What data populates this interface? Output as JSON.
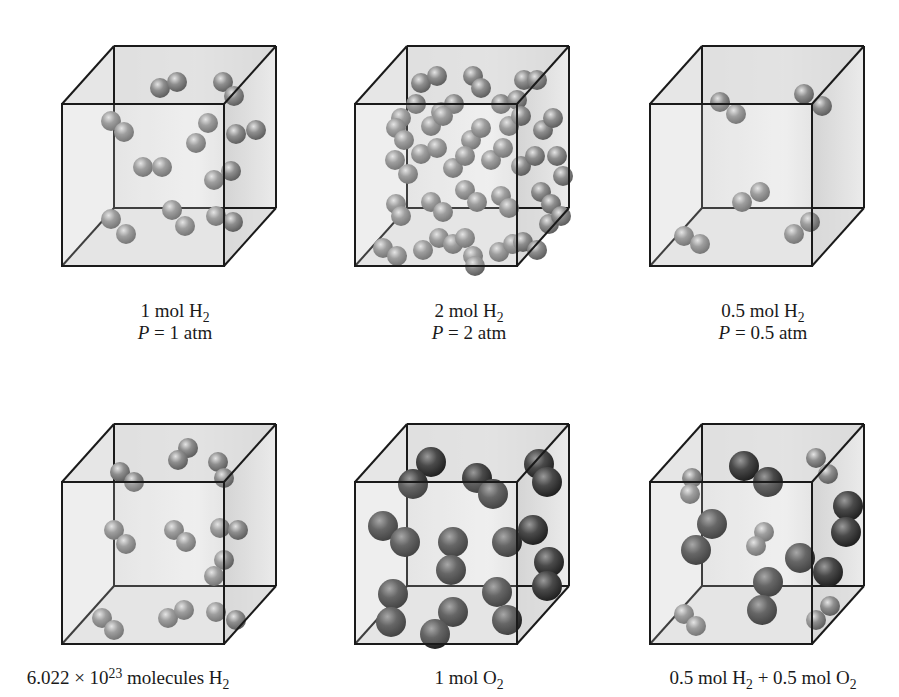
{
  "figure": {
    "colors": {
      "background": "#ffffff",
      "edge": "#1a1a1a",
      "face": "#d6d6d6",
      "h2": "#8e8e8e",
      "o2": "#4a4a4a"
    },
    "cube_geometry": {
      "front_size": 162,
      "depth_dx": 52,
      "depth_dy": 58
    },
    "panels": [
      {
        "id": "1mol-h2",
        "origin": [
          62,
          46
        ],
        "label_line1": {
          "pre": "1 mol H",
          "sub": "2",
          "post": ""
        },
        "label_line2": {
          "var": "P",
          "rest": " = 1 atm"
        },
        "label_pos": [
          175,
          300
        ],
        "molecules": [
          {
            "type": "h2",
            "atoms": [
              [
                92,
                32
              ],
              [
                109,
                26
              ]
            ]
          },
          {
            "type": "h2",
            "atoms": [
              [
                155,
                26
              ],
              [
                166,
                40
              ]
            ]
          },
          {
            "type": "h2",
            "atoms": [
              [
                43,
                65
              ],
              [
                56,
                76
              ]
            ]
          },
          {
            "type": "h2",
            "atoms": [
              [
                140,
                67
              ],
              [
                128,
                87
              ]
            ]
          },
          {
            "type": "h2",
            "atoms": [
              [
                168,
                78
              ],
              [
                188,
                74
              ]
            ]
          },
          {
            "type": "h2",
            "atoms": [
              [
                75,
                111
              ],
              [
                94,
                111
              ]
            ]
          },
          {
            "type": "h2",
            "atoms": [
              [
                146,
                124
              ],
              [
                163,
                115
              ]
            ]
          },
          {
            "type": "h2",
            "atoms": [
              [
                43,
                163
              ],
              [
                58,
                178
              ]
            ]
          },
          {
            "type": "h2",
            "atoms": [
              [
                104,
                154
              ],
              [
                117,
                170
              ]
            ]
          },
          {
            "type": "h2",
            "atoms": [
              [
                148,
                160
              ],
              [
                165,
                166
              ]
            ]
          }
        ]
      },
      {
        "id": "2mol-h2",
        "origin": [
          355,
          46
        ],
        "label_line1": {
          "pre": "2 mol H",
          "sub": "2",
          "post": ""
        },
        "label_line2": {
          "var": "P",
          "rest": " = 2 atm"
        },
        "label_pos": [
          469,
          300
        ],
        "molecules": [
          {
            "type": "h2",
            "atoms": [
              [
                60,
                27
              ],
              [
                76,
                20
              ]
            ]
          },
          {
            "type": "h2",
            "atoms": [
              [
                112,
                20
              ],
              [
                120,
                32
              ]
            ]
          },
          {
            "type": "h2",
            "atoms": [
              [
                163,
                24
              ],
              [
                176,
                24
              ]
            ]
          },
          {
            "type": "h2",
            "atoms": [
              [
                40,
                62
              ],
              [
                55,
                48
              ]
            ]
          },
          {
            "type": "h2",
            "atoms": [
              [
                80,
                56
              ],
              [
                93,
                48
              ]
            ]
          },
          {
            "type": "h2",
            "atoms": [
              [
                140,
                48
              ],
              [
                156,
                44
              ]
            ]
          },
          {
            "type": "h2",
            "atoms": [
              [
                35,
                72
              ],
              [
                43,
                84
              ]
            ]
          },
          {
            "type": "h2",
            "atoms": [
              [
                70,
                70
              ],
              [
                82,
                60
              ]
            ]
          },
          {
            "type": "h2",
            "atoms": [
              [
                110,
                84
              ],
              [
                120,
                72
              ]
            ]
          },
          {
            "type": "h2",
            "atoms": [
              [
                148,
                70
              ],
              [
                160,
                60
              ]
            ]
          },
          {
            "type": "h2",
            "atoms": [
              [
                182,
                74
              ],
              [
                192,
                62
              ]
            ]
          },
          {
            "type": "h2",
            "atoms": [
              [
                34,
                104
              ],
              [
                47,
                118
              ]
            ]
          },
          {
            "type": "h2",
            "atoms": [
              [
                60,
                98
              ],
              [
                76,
                92
              ]
            ]
          },
          {
            "type": "h2",
            "atoms": [
              [
                92,
                112
              ],
              [
                104,
                100
              ]
            ]
          },
          {
            "type": "h2",
            "atoms": [
              [
                130,
                104
              ],
              [
                142,
                92
              ]
            ]
          },
          {
            "type": "h2",
            "atoms": [
              [
                160,
                110
              ],
              [
                174,
                100
              ]
            ]
          },
          {
            "type": "h2",
            "atoms": [
              [
                35,
                148
              ],
              [
                40,
                160
              ]
            ]
          },
          {
            "type": "h2",
            "atoms": [
              [
                70,
                146
              ],
              [
                82,
                156
              ]
            ]
          },
          {
            "type": "h2",
            "atoms": [
              [
                104,
                134
              ],
              [
                116,
                146
              ]
            ]
          },
          {
            "type": "h2",
            "atoms": [
              [
                140,
                140
              ],
              [
                148,
                152
              ]
            ]
          },
          {
            "type": "h2",
            "atoms": [
              [
                180,
                136
              ],
              [
                190,
                148
              ]
            ]
          },
          {
            "type": "h2",
            "atoms": [
              [
                22,
                192
              ],
              [
                36,
                200
              ]
            ]
          },
          {
            "type": "h2",
            "atoms": [
              [
                62,
                194
              ],
              [
                78,
                182
              ]
            ]
          },
          {
            "type": "h2",
            "atoms": [
              [
                92,
                188
              ],
              [
                104,
                182
              ]
            ]
          },
          {
            "type": "h2",
            "atoms": [
              [
                112,
                200
              ],
              [
                114,
                210
              ]
            ]
          },
          {
            "type": "h2",
            "atoms": [
              [
                138,
                196
              ],
              [
                152,
                188
              ]
            ]
          },
          {
            "type": "h2",
            "atoms": [
              [
                162,
                186
              ],
              [
                176,
                194
              ]
            ]
          },
          {
            "type": "h2",
            "atoms": [
              [
                196,
                100
              ],
              [
                202,
                120
              ]
            ]
          },
          {
            "type": "h2",
            "atoms": [
              [
                188,
                168
              ],
              [
                200,
                160
              ]
            ]
          }
        ]
      },
      {
        "id": "0.5mol-h2",
        "origin": [
          650,
          46
        ],
        "label_line1": {
          "pre": "0.5 mol H",
          "sub": "2",
          "post": ""
        },
        "label_line2": {
          "var": "P",
          "rest": " = 0.5 atm"
        },
        "label_pos": [
          763,
          300
        ],
        "molecules": [
          {
            "type": "h2",
            "atoms": [
              [
                64,
                46
              ],
              [
                80,
                58
              ]
            ]
          },
          {
            "type": "h2",
            "atoms": [
              [
                148,
                38
              ],
              [
                166,
                50
              ]
            ]
          },
          {
            "type": "h2",
            "atoms": [
              [
                86,
                146
              ],
              [
                104,
                136
              ]
            ]
          },
          {
            "type": "h2",
            "atoms": [
              [
                28,
                180
              ],
              [
                44,
                188
              ]
            ]
          },
          {
            "type": "h2",
            "atoms": [
              [
                138,
                178
              ],
              [
                154,
                166
              ]
            ]
          }
        ]
      },
      {
        "id": "molecules-h2",
        "origin": [
          62,
          424
        ],
        "label_line1": {
          "pre": "6.022 × 10",
          "sup": "23",
          "post": " molecules H",
          "sub": "2"
        },
        "label_line2": null,
        "label_pos": [
          128,
          667
        ],
        "molecules": [
          {
            "type": "h2",
            "atoms": [
              [
                120,
                14
              ],
              [
                110,
                26
              ]
            ]
          },
          {
            "type": "h2",
            "atoms": [
              [
                150,
                28
              ],
              [
                156,
                44
              ]
            ]
          },
          {
            "type": "h2",
            "atoms": [
              [
                52,
                38
              ],
              [
                66,
                48
              ]
            ]
          },
          {
            "type": "h2",
            "atoms": [
              [
                46,
                96
              ],
              [
                58,
                110
              ]
            ]
          },
          {
            "type": "h2",
            "atoms": [
              [
                106,
                96
              ],
              [
                118,
                108
              ]
            ]
          },
          {
            "type": "h2",
            "atoms": [
              [
                152,
                94
              ],
              [
                170,
                96
              ]
            ]
          },
          {
            "type": "h2",
            "atoms": [
              [
                156,
                126
              ],
              [
                146,
                142
              ]
            ]
          },
          {
            "type": "h2",
            "atoms": [
              [
                34,
                184
              ],
              [
                46,
                196
              ]
            ]
          },
          {
            "type": "h2",
            "atoms": [
              [
                100,
                184
              ],
              [
                116,
                176
              ]
            ]
          },
          {
            "type": "h2",
            "atoms": [
              [
                148,
                178
              ],
              [
                168,
                186
              ]
            ]
          }
        ]
      },
      {
        "id": "1mol-o2",
        "origin": [
          355,
          424
        ],
        "label_line1": {
          "pre": "1 mol O",
          "sub": "2",
          "post": ""
        },
        "label_line2": null,
        "label_pos": [
          469,
          667
        ],
        "molecules": [
          {
            "type": "o2",
            "atoms": [
              [
                70,
                28
              ],
              [
                52,
                50
              ]
            ]
          },
          {
            "type": "o2",
            "atoms": [
              [
                116,
                44
              ],
              [
                132,
                60
              ]
            ]
          },
          {
            "type": "o2",
            "atoms": [
              [
                178,
                30
              ],
              [
                186,
                48
              ]
            ]
          },
          {
            "type": "o2",
            "atoms": [
              [
                22,
                92
              ],
              [
                44,
                108
              ]
            ]
          },
          {
            "type": "o2",
            "atoms": [
              [
                92,
                108
              ],
              [
                90,
                136
              ]
            ]
          },
          {
            "type": "o2",
            "atoms": [
              [
                146,
                108
              ],
              [
                172,
                96
              ]
            ]
          },
          {
            "type": "o2",
            "atoms": [
              [
                188,
                128
              ],
              [
                186,
                152
              ]
            ]
          },
          {
            "type": "o2",
            "atoms": [
              [
                32,
                160
              ],
              [
                30,
                188
              ]
            ]
          },
          {
            "type": "o2",
            "atoms": [
              [
                92,
                178
              ],
              [
                74,
                200
              ]
            ]
          },
          {
            "type": "o2",
            "atoms": [
              [
                136,
                158
              ],
              [
                146,
                186
              ]
            ]
          }
        ]
      },
      {
        "id": "mixture",
        "origin": [
          650,
          424
        ],
        "label_line1": {
          "pre": "0.5 mol H",
          "sub": "2",
          "mid": " + 0.5 mol O",
          "sub2": "2"
        },
        "label_line2": null,
        "label_pos": [
          763,
          667
        ],
        "molecules": [
          {
            "type": "o2",
            "atoms": [
              [
                88,
                32
              ],
              [
                112,
                48
              ]
            ]
          },
          {
            "type": "h2",
            "atoms": [
              [
                160,
                24
              ],
              [
                172,
                40
              ]
            ]
          },
          {
            "type": "h2",
            "atoms": [
              [
                36,
                44
              ],
              [
                34,
                60
              ]
            ]
          },
          {
            "type": "o2",
            "atoms": [
              [
                192,
                72
              ],
              [
                190,
                98
              ]
            ]
          },
          {
            "type": "o2",
            "atoms": [
              [
                56,
                90
              ],
              [
                40,
                116
              ]
            ]
          },
          {
            "type": "h2",
            "atoms": [
              [
                108,
                98
              ],
              [
                100,
                112
              ]
            ]
          },
          {
            "type": "o2",
            "atoms": [
              [
                144,
                124
              ],
              [
                172,
                138
              ]
            ]
          },
          {
            "type": "o2",
            "atoms": [
              [
                112,
                148
              ],
              [
                106,
                176
              ]
            ]
          },
          {
            "type": "h2",
            "atoms": [
              [
                28,
                180
              ],
              [
                40,
                192
              ]
            ]
          },
          {
            "type": "h2",
            "atoms": [
              [
                174,
                172
              ],
              [
                160,
                186
              ]
            ]
          }
        ]
      }
    ]
  }
}
